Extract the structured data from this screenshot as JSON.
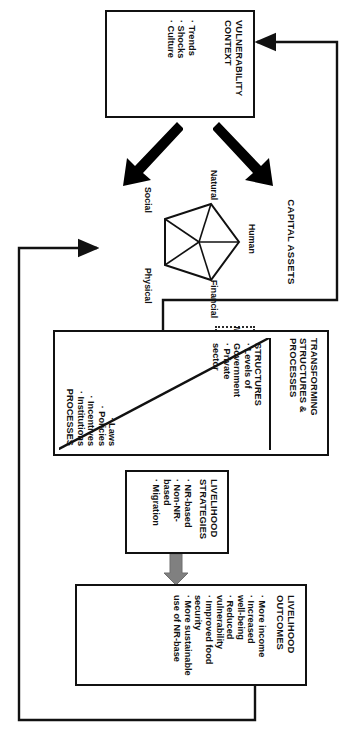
{
  "diagram": {
    "type": "framework-diagram",
    "rotation_deg": 90,
    "accent": "#111111",
    "arrow_grey": "#808080",
    "arrow_black": "#000000"
  },
  "vulnerability": {
    "title": "VULNERABILITY\nCONTEXT",
    "title_lines": [
      "VULNERABILITY",
      "CONTEXT"
    ],
    "bullets": [
      "· Trends",
      "· Shocks",
      "· Culture"
    ]
  },
  "capital_assets": {
    "title": "CAPITAL ASSETS",
    "vertices": [
      {
        "key": "human",
        "label": "Human"
      },
      {
        "key": "financial",
        "label": "Financial"
      },
      {
        "key": "physical",
        "label": "Physical"
      },
      {
        "key": "social",
        "label": "Social"
      },
      {
        "key": "natural",
        "label": "Natural"
      }
    ]
  },
  "influence": {
    "label": "Influence",
    "arrows": [
      "arrow-right",
      "arrow-left"
    ]
  },
  "transforming": {
    "title_lines": [
      "TRANSFORMING",
      "STRUCTURES &",
      "PROCESSES"
    ],
    "structures": {
      "heading": "STRUCTURES",
      "bullets": [
        "· Levels of",
        "Government",
        "· Private",
        "sector"
      ]
    },
    "processes": {
      "heading": "PROCESSES",
      "bullets": [
        "· Laws",
        "· Policies",
        "· Incentives",
        "· Institutions"
      ]
    }
  },
  "strategies": {
    "title_lines": [
      "LIVELIHOOD",
      "STRATEGIES"
    ],
    "bullets": [
      "· NR-based",
      "· Non-NR-",
      "based",
      "· Migration"
    ]
  },
  "outcomes": {
    "title_lines": [
      "LIVELIHOOD",
      "OUTCOMES"
    ],
    "bullets": [
      "· More income",
      "· Increased",
      "well-being",
      "· Reduced",
      "vulnerability",
      "· Improved food",
      "security",
      "· More sustainable",
      "use of NR-base"
    ]
  },
  "connectors": {
    "feedback_outcomes_to_assets": "outcomes-right → down → arrow-left into capital-assets",
    "feedback_tsp_to_vulnerability": "transforming-left → down → arrow-right into vulnerability-context",
    "strategies_to_outcomes": "grey-arrow-right",
    "vulnerability_to_assets": "two thick black arrows"
  }
}
